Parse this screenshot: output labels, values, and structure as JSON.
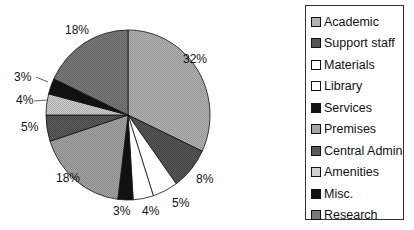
{
  "chart_data": {
    "type": "pie",
    "title": "",
    "start_angle_deg": 0,
    "direction": "clockwise",
    "categories": [
      "Academic",
      "Support staff",
      "Materials",
      "Library",
      "Services",
      "Premises",
      "Central Admin",
      "Amenities",
      "Misc.",
      "Research"
    ],
    "values": [
      32,
      8,
      5,
      4,
      3,
      18,
      5,
      4,
      3,
      18
    ],
    "labels": [
      "32%",
      "8%",
      "5%",
      "4%",
      "3%",
      "18%",
      "5%",
      "4%",
      "3%",
      "18%"
    ],
    "colors": [
      "#b4b4b4",
      "#555555",
      "#ffffff",
      "#ffffff",
      "#111111",
      "#a6a6a6",
      "#5a5a5a",
      "#d0d0d0",
      "#111111",
      "#7a7a7a"
    ],
    "legend_position": "right"
  },
  "legend": {
    "items": [
      {
        "label": "Academic",
        "color": "#b4b4b4"
      },
      {
        "label": "Support staff",
        "color": "#555555"
      },
      {
        "label": "Materials",
        "color": "#ffffff"
      },
      {
        "label": "Library",
        "color": "#ffffff"
      },
      {
        "label": "Services",
        "color": "#111111"
      },
      {
        "label": "Premises",
        "color": "#a6a6a6"
      },
      {
        "label": "Central Admin",
        "color": "#5a5a5a"
      },
      {
        "label": "Amenities",
        "color": "#d0d0d0"
      },
      {
        "label": "Misc.",
        "color": "#111111"
      },
      {
        "label": "Research",
        "color": "#7a7a7a"
      }
    ]
  }
}
